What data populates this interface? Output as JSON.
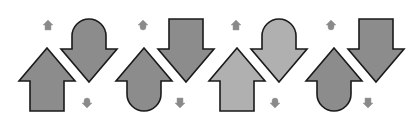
{
  "figure": {
    "background": "#ffffff",
    "stroke": "#1a1a1a",
    "panels": [
      {
        "id": "panel-1",
        "offset_x": 0,
        "fill": "#8c8c8c",
        "up_arrow": {
          "tail": "square"
        },
        "down_arrow": {
          "tail": "round"
        },
        "small_top": {
          "shape": "up-arrow",
          "x": 48,
          "y": 25
        },
        "small_bottom": {
          "shape": "round-marker",
          "x": 87,
          "y": 103
        }
      },
      {
        "id": "panel-2",
        "offset_x": 97,
        "fill": "#8c8c8c",
        "up_arrow": {
          "tail": "round"
        },
        "down_arrow": {
          "tail": "square"
        },
        "small_top": {
          "shape": "round-up-marker",
          "x": 143,
          "y": 25
        },
        "small_bottom": {
          "shape": "down-arrow",
          "x": 180,
          "y": 103
        }
      },
      {
        "id": "panel-3",
        "offset_x": 190,
        "fill": "#b0b0b0",
        "up_arrow": {
          "tail": "square"
        },
        "down_arrow": {
          "tail": "round"
        },
        "small_top": {
          "shape": "up-arrow",
          "x": 236,
          "y": 25
        },
        "small_bottom": {
          "shape": "round-marker",
          "x": 275,
          "y": 103
        }
      },
      {
        "id": "panel-4",
        "offset_x": 287,
        "fill": "#8c8c8c",
        "up_arrow": {
          "tail": "round"
        },
        "down_arrow": {
          "tail": "square"
        },
        "small_top": {
          "shape": "round-up-marker",
          "x": 331,
          "y": 25
        },
        "small_bottom": {
          "shape": "down-arrow",
          "x": 368,
          "y": 103
        }
      }
    ]
  }
}
